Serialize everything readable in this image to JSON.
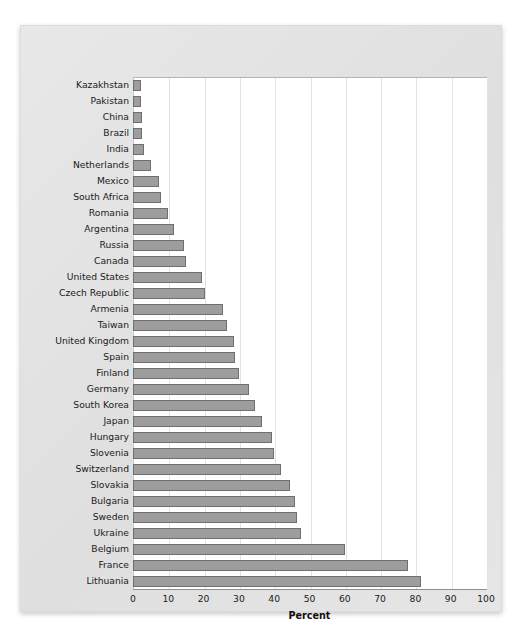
{
  "chart_data": {
    "type": "bar",
    "orientation": "horizontal",
    "title": "",
    "xlabel": "Percent",
    "ylabel": "",
    "xlim": [
      0,
      100
    ],
    "xticks": [
      0,
      10,
      20,
      30,
      40,
      50,
      60,
      70,
      80,
      90,
      100
    ],
    "grid": true,
    "legend": false,
    "bar_color": "#9d9d9d",
    "bar_edge_color": "#6f6f6f",
    "panel_color": "#ffffff",
    "figure_color": "#e3e3e3",
    "categories": [
      "Kazakhstan",
      "Pakistan",
      "China",
      "Brazil",
      "India",
      "Netherlands",
      "Mexico",
      "South Africa",
      "Romania",
      "Argentina",
      "Russia",
      "Canada",
      "United States",
      "Czech Republic",
      "Armenia",
      "Taiwan",
      "United Kingdom",
      "Spain",
      "Finland",
      "Germany",
      "South Korea",
      "Japan",
      "Hungary",
      "Slovenia",
      "Switzerland",
      "Slovakia",
      "Bulgaria",
      "Sweden",
      "Ukraine",
      "Belgium",
      "France",
      "Lithuania"
    ],
    "values": [
      2.2,
      2.3,
      2.5,
      2.6,
      3.1,
      5.0,
      7.5,
      8.0,
      10.0,
      11.5,
      14.5,
      15.0,
      19.5,
      20.5,
      25.5,
      26.5,
      28.5,
      29.0,
      30.0,
      33.0,
      34.5,
      36.5,
      39.5,
      40.0,
      42.0,
      44.5,
      46.0,
      46.5,
      47.5,
      60.0,
      78.0,
      81.5
    ]
  }
}
